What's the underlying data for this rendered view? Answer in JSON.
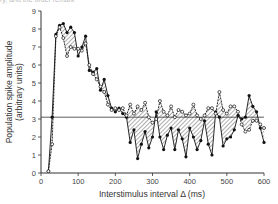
{
  "caption": "ry, and the order remark",
  "chart_data": {
    "type": "line",
    "title": "",
    "xlabel": "Interstimulus interval Δ (ms)",
    "ylabel": "Population spike amplitude",
    "ylabel_sub": "(arbitrary units)",
    "xlim": [
      0,
      600
    ],
    "ylim": [
      0,
      9
    ],
    "xticks": [
      0,
      100,
      200,
      300,
      400,
      500,
      600
    ],
    "yticks": [
      0,
      1,
      2,
      3,
      4,
      5,
      6,
      7,
      8,
      9
    ],
    "grid": false,
    "reference_line": {
      "y": 3.1,
      "label": "control level"
    },
    "fill_between_series": "hatched",
    "series": [
      {
        "name": "filled",
        "marker": "filled-circle",
        "color": "#111111",
        "x": [
          20,
          30,
          40,
          50,
          60,
          70,
          80,
          90,
          100,
          110,
          120,
          130,
          140,
          150,
          160,
          170,
          180,
          190,
          200,
          210,
          220,
          230,
          240,
          250,
          260,
          270,
          280,
          290,
          300,
          310,
          320,
          330,
          340,
          350,
          360,
          370,
          380,
          390,
          400,
          410,
          420,
          430,
          440,
          450,
          460,
          470,
          480,
          490,
          500,
          510,
          520,
          530,
          540,
          550,
          560,
          570,
          580,
          590,
          600
        ],
        "values": [
          0.1,
          3.1,
          7.7,
          8.2,
          8.3,
          7.8,
          8.1,
          7.8,
          6.5,
          7.0,
          7.6,
          5.7,
          5.6,
          5.8,
          4.6,
          5.2,
          4.3,
          3.6,
          3.4,
          3.6,
          3.3,
          3.1,
          1.7,
          2.4,
          0.8,
          1.6,
          2.3,
          1.4,
          2.0,
          3.4,
          2.0,
          1.3,
          2.1,
          2.5,
          1.3,
          2.4,
          1.9,
          0.9,
          2.5,
          2.0,
          1.3,
          1.8,
          2.9,
          1.6,
          1.0,
          3.4,
          3.1,
          1.5,
          1.9,
          2.0,
          2.4,
          3.2,
          3.0,
          3.1,
          4.3,
          3.7,
          3.4,
          2.5,
          1.7
        ]
      },
      {
        "name": "open",
        "marker": "open-circle",
        "color": "#111111",
        "x": [
          20,
          30,
          40,
          50,
          60,
          70,
          80,
          90,
          100,
          110,
          120,
          130,
          140,
          150,
          160,
          170,
          180,
          190,
          200,
          210,
          220,
          230,
          240,
          250,
          260,
          270,
          280,
          290,
          300,
          310,
          320,
          330,
          340,
          350,
          360,
          370,
          380,
          390,
          400,
          410,
          420,
          430,
          440,
          450,
          460,
          470,
          480,
          490,
          500,
          510,
          520,
          530,
          540,
          550,
          560,
          570,
          580,
          590,
          600
        ],
        "values": [
          0.1,
          1.6,
          7.6,
          8.1,
          7.5,
          6.5,
          7.0,
          6.9,
          6.9,
          6.8,
          7.2,
          6.0,
          5.5,
          5.2,
          4.8,
          4.5,
          3.8,
          3.5,
          3.6,
          3.5,
          3.6,
          3.2,
          3.8,
          3.3,
          3.7,
          3.5,
          3.9,
          3.1,
          2.8,
          3.0,
          4.0,
          3.4,
          3.2,
          3.7,
          3.1,
          3.5,
          3.4,
          3.2,
          3.3,
          3.8,
          3.2,
          3.0,
          3.2,
          3.6,
          3.6,
          3.3,
          4.5,
          3.5,
          3.3,
          3.7,
          3.7,
          3.4,
          2.7,
          2.3,
          2.4,
          2.9,
          2.9,
          2.7,
          2.5
        ]
      }
    ]
  }
}
